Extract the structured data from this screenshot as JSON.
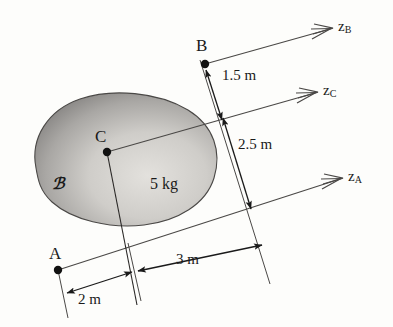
{
  "figure": {
    "background_color": "#fdfdfb",
    "ink_color": "#1a1a1a"
  },
  "body": {
    "name_label": "ℬ",
    "mass_label": "5 kg",
    "fill_light": "#d8d6d2",
    "fill_dark": "#8f8d8b"
  },
  "points": [
    {
      "key": "A",
      "label": "A",
      "x": 58,
      "y": 270
    },
    {
      "key": "B",
      "label": "B",
      "x": 205,
      "y": 64
    },
    {
      "key": "C",
      "label": "C",
      "x": 107,
      "y": 152
    }
  ],
  "axes": [
    {
      "key": "zB",
      "label": "z",
      "subscript": "B",
      "x": 345,
      "y": 28
    },
    {
      "key": "zC",
      "label": "z",
      "subscript": "C",
      "x": 330,
      "y": 92
    },
    {
      "key": "zA",
      "label": "z",
      "subscript": "A",
      "x": 355,
      "y": 178
    }
  ],
  "dimensions": [
    {
      "key": "d15",
      "label": "1.5 m",
      "x": 228,
      "y": 76
    },
    {
      "key": "d25",
      "label": "2.5 m",
      "x": 243,
      "y": 145
    },
    {
      "key": "d2",
      "label": "2 m",
      "x": 92,
      "y": 290
    },
    {
      "key": "d3",
      "label": "3 m",
      "x": 189,
      "y": 262
    }
  ]
}
